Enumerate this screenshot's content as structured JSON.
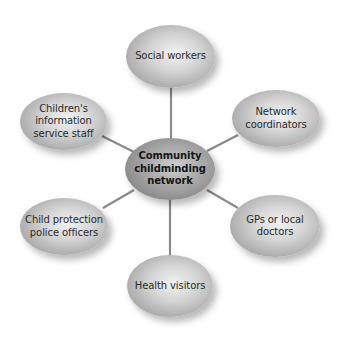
{
  "diagram": {
    "type": "hub-and-spoke",
    "line_color": "#8a8a8a",
    "center": {
      "label": "Community\nchildminding\nnetwork"
    },
    "nodes": {
      "top": {
        "label": "Social workers"
      },
      "upper_left": {
        "label": "Children's\ninformation\nservice staff"
      },
      "upper_right": {
        "label": "Network\ncoordinators"
      },
      "lower_left": {
        "label": "Child protection\npolice officers"
      },
      "lower_right": {
        "label": "GPs or local\ndoctors"
      },
      "bottom": {
        "label": "Health visitors"
      }
    }
  }
}
